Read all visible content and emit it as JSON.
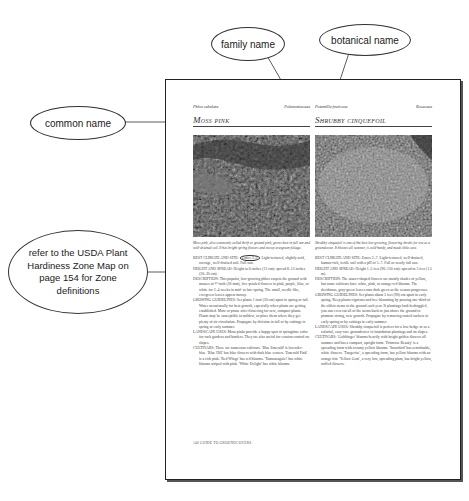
{
  "callouts": {
    "family_name": "family name",
    "botanical_name": "botanical name",
    "common_name": "common name",
    "zone_note": "refer to the USDA Plant Hardiness Zone Map on page 154 for Zone definitions"
  },
  "page": {
    "footer": "140 GUIDE TO GROUNDCOVERS",
    "left": {
      "botanical": "Phlox subulata",
      "family": "Polemoniaceae",
      "common": "Moss pink",
      "caption": "Moss pink, also commonly called thrift or ground pink, grows best in full sun and well-drained soil. It has bright spring flowers and mossy evergreen foliage.",
      "sections": [
        {
          "label": "BEST CLIMATE AND SITE:",
          "zones": "Zones 3–9.",
          "text": " Light-textured, slightly acid, average, well-drained soil. Full sun."
        },
        {
          "label": "HEIGHT AND SPREAD:",
          "text": " Height to 6 inches (15 cm); spread 8–12 inches (20–30 cm)."
        },
        {
          "label": "DESCRIPTION:",
          "text": " This popular, low-growing phlox carpets the ground with masses of ½-inch (18 mm), five-petaled flowers in pink, purple, lilac, or white for 2–4 weeks in mid- to late-spring. The small, needle-like, evergreen leaves appear mossy."
        },
        {
          "label": "GROWING GUIDELINES:",
          "text": " Set plants 1 foot (30 cm) apart in spring or fall. Water occasionally for best growth, especially when plants are getting established. Mow or prune after flowering for new, compact plants. Plants may be susceptible to mildew, so place them where they get plenty of air circulation. Propagate by division in fall or by cuttings in spring or early summer."
        },
        {
          "label": "LANDSCAPE USES:",
          "text": " Moss pinks provide a happy spot of springtime color for rock gardens and borders. They are also useful for erosion control on slopes."
        },
        {
          "label": "CULTIVARS:",
          "text": " There are numerous cultivars. 'Blue Emerald' is lavender-blue. 'Blue Hill' has blue flowers with dark blue centers. 'Emerald Pink' is a rich pink. 'Red Wings' has red blooms. 'Tamaonagalei' has white blooms striped with pink. 'White Delight' has white blooms."
        }
      ]
    },
    "right": {
      "botanical": "Potentilla fruticosa",
      "family": "Rosaceae",
      "common": "Shrubby cinquefoil",
      "caption": "Shrubby cinquefoil is one of the best low-growing, flowering shrubs for use as a groundcover. It blooms all summer, is cold-hardy, and needs little care.",
      "sections": [
        {
          "label": "BEST CLIMATE AND SITE:",
          "text": " Zones 2–7. Light-textured, well-drained, humus-rich, fertile soil with a pH of 5–7. Full or nearly full sun."
        },
        {
          "label": "HEIGHT AND SPREAD:",
          "text": " Height 1–5 feet (90–150 cm); spread to 5 feet (1.5 m)."
        },
        {
          "label": "DESCRIPTION:",
          "text": " The saucer-shaped flowers are mostly shades of yellow, but some cultivars have white, pink, or orange-red blooms. The deciduous, gray-green leaves turn dark green as the season progresses."
        },
        {
          "label": "GROWING GUIDELINES:",
          "text": " Set plants about 3 feet (90) cm apart in early spring. Keep plants vigorous and free-blooming by pruning one-third of the oldest stems to the ground each year. If plantings look bedraggled, you can even cut all of the stems back to just above the ground to promote strong, new growth. Propagate by removing rooted suckers in early spring or by cuttings in early summer."
        },
        {
          "label": "LANDSCAPE USES:",
          "text": " Shrubby cinquefoil is perfect for a low hedge or as a colorful, easy-care groundcover in foundation plantings and on slopes."
        },
        {
          "label": "CULTIVARS:",
          "text": " 'Goldfinger' blooms heavily with bright golden flowers all summer and has a compact, upright form. 'Primrose Beauty' is a spreading form with creamy yellow blooms. 'Snowbird' has semidouble, white flowers. 'Tangerine', a spreading form, has yellow blooms with an orange tint. 'Yellow Gem', a very low, spreading plant, has bright yellow, ruffled flowers."
        }
      ]
    }
  }
}
